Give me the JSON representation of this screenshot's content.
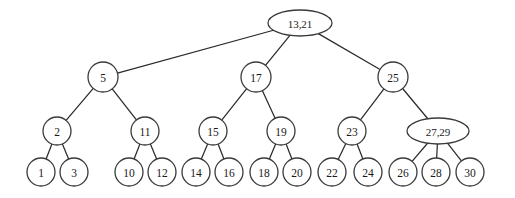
{
  "diagram": {
    "type": "tree",
    "title": "",
    "canvas": {
      "width": 515,
      "height": 198,
      "background": "#ffffff"
    },
    "style": {
      "node_fill": "#ffffff",
      "node_stroke": "#3a3a3a",
      "edge_stroke": "#2b2b2b",
      "label_color": "#1a1a1a"
    },
    "levels": [
      {
        "name": "root",
        "y": 23
      },
      {
        "name": "internal-level-1",
        "y": 77
      },
      {
        "name": "internal-level-2",
        "y": 131
      },
      {
        "name": "leaves",
        "y": 172
      }
    ],
    "nodes": [
      {
        "id": "n0",
        "label": "13,21",
        "x": 300,
        "y": 23,
        "rx": 32,
        "ry": 13,
        "shape": "ellipse",
        "keys": [
          13,
          21
        ],
        "level": 0
      },
      {
        "id": "n1",
        "label": "5",
        "x": 103,
        "y": 77,
        "rx": 15,
        "ry": 15,
        "shape": "circle",
        "keys": [
          5
        ],
        "level": 1
      },
      {
        "id": "n2",
        "label": "17",
        "x": 256,
        "y": 77,
        "rx": 15,
        "ry": 15,
        "shape": "circle",
        "keys": [
          17
        ],
        "level": 1
      },
      {
        "id": "n3",
        "label": "25",
        "x": 393,
        "y": 77,
        "rx": 15,
        "ry": 15,
        "shape": "circle",
        "keys": [
          25
        ],
        "level": 1
      },
      {
        "id": "n4",
        "label": "2",
        "x": 57,
        "y": 131,
        "rx": 14,
        "ry": 14,
        "shape": "circle",
        "keys": [
          2
        ],
        "level": 2
      },
      {
        "id": "n5",
        "label": "11",
        "x": 145,
        "y": 131,
        "rx": 14,
        "ry": 14,
        "shape": "circle",
        "keys": [
          11
        ],
        "level": 2
      },
      {
        "id": "n6",
        "label": "15",
        "x": 213,
        "y": 131,
        "rx": 14,
        "ry": 14,
        "shape": "circle",
        "keys": [
          15
        ],
        "level": 2
      },
      {
        "id": "n7",
        "label": "19",
        "x": 281,
        "y": 131,
        "rx": 14,
        "ry": 14,
        "shape": "circle",
        "keys": [
          19
        ],
        "level": 2
      },
      {
        "id": "n8",
        "label": "23",
        "x": 352,
        "y": 131,
        "rx": 14,
        "ry": 14,
        "shape": "circle",
        "keys": [
          23
        ],
        "level": 2
      },
      {
        "id": "n9",
        "label": "27,29",
        "x": 438,
        "y": 131,
        "rx": 31,
        "ry": 13,
        "shape": "ellipse",
        "keys": [
          27,
          29
        ],
        "level": 2
      },
      {
        "id": "l1",
        "label": "1",
        "x": 41,
        "y": 172,
        "rx": 14,
        "ry": 14,
        "shape": "circle",
        "keys": [
          1
        ],
        "level": 3
      },
      {
        "id": "l3",
        "label": "3",
        "x": 74,
        "y": 172,
        "rx": 14,
        "ry": 14,
        "shape": "circle",
        "keys": [
          3
        ],
        "level": 3
      },
      {
        "id": "l10",
        "label": "10",
        "x": 129,
        "y": 172,
        "rx": 14,
        "ry": 14,
        "shape": "circle",
        "keys": [
          10
        ],
        "level": 3
      },
      {
        "id": "l12",
        "label": "12",
        "x": 162,
        "y": 172,
        "rx": 14,
        "ry": 14,
        "shape": "circle",
        "keys": [
          12
        ],
        "level": 3
      },
      {
        "id": "l14",
        "label": "14",
        "x": 196,
        "y": 172,
        "rx": 14,
        "ry": 14,
        "shape": "circle",
        "keys": [
          14
        ],
        "level": 3
      },
      {
        "id": "l16",
        "label": "16",
        "x": 229,
        "y": 172,
        "rx": 14,
        "ry": 14,
        "shape": "circle",
        "keys": [
          16
        ],
        "level": 3
      },
      {
        "id": "l18",
        "label": "18",
        "x": 264,
        "y": 172,
        "rx": 14,
        "ry": 14,
        "shape": "circle",
        "keys": [
          18
        ],
        "level": 3
      },
      {
        "id": "l20",
        "label": "20",
        "x": 297,
        "y": 172,
        "rx": 14,
        "ry": 14,
        "shape": "circle",
        "keys": [
          20
        ],
        "level": 3
      },
      {
        "id": "l22",
        "label": "22",
        "x": 332,
        "y": 172,
        "rx": 14,
        "ry": 14,
        "shape": "circle",
        "keys": [
          22
        ],
        "level": 3
      },
      {
        "id": "l24",
        "label": "24",
        "x": 368,
        "y": 172,
        "rx": 14,
        "ry": 14,
        "shape": "circle",
        "keys": [
          24
        ],
        "level": 3
      },
      {
        "id": "l26",
        "label": "26",
        "x": 403,
        "y": 172,
        "rx": 14,
        "ry": 14,
        "shape": "circle",
        "keys": [
          26
        ],
        "level": 3
      },
      {
        "id": "l28",
        "label": "28",
        "x": 436,
        "y": 172,
        "rx": 14,
        "ry": 14,
        "shape": "circle",
        "keys": [
          28
        ],
        "level": 3
      },
      {
        "id": "l30",
        "label": "30",
        "x": 470,
        "y": 172,
        "rx": 14,
        "ry": 14,
        "shape": "circle",
        "keys": [
          30
        ],
        "level": 3
      }
    ],
    "edges": [
      {
        "from": "n0",
        "to": "n1"
      },
      {
        "from": "n0",
        "to": "n2"
      },
      {
        "from": "n0",
        "to": "n3"
      },
      {
        "from": "n1",
        "to": "n4"
      },
      {
        "from": "n1",
        "to": "n5"
      },
      {
        "from": "n2",
        "to": "n6"
      },
      {
        "from": "n2",
        "to": "n7"
      },
      {
        "from": "n3",
        "to": "n8"
      },
      {
        "from": "n3",
        "to": "n9"
      },
      {
        "from": "n4",
        "to": "l1"
      },
      {
        "from": "n4",
        "to": "l3"
      },
      {
        "from": "n5",
        "to": "l10"
      },
      {
        "from": "n5",
        "to": "l12"
      },
      {
        "from": "n6",
        "to": "l14"
      },
      {
        "from": "n6",
        "to": "l16"
      },
      {
        "from": "n7",
        "to": "l18"
      },
      {
        "from": "n7",
        "to": "l20"
      },
      {
        "from": "n8",
        "to": "l22"
      },
      {
        "from": "n8",
        "to": "l24"
      },
      {
        "from": "n9",
        "to": "l26"
      },
      {
        "from": "n9",
        "to": "l28"
      },
      {
        "from": "n9",
        "to": "l30"
      }
    ]
  }
}
